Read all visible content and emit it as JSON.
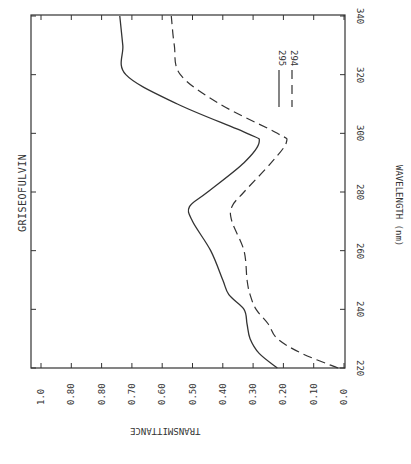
{
  "title": "GRISEOFULVIN",
  "chart_data": {
    "type": "line",
    "title": "GRISEOFULVIN",
    "xlabel": "WAVELENGTH (nm)",
    "ylabel": "TRANSMITTANCE",
    "orientation_note": "figure printed rotated 90 degrees; wavelength axis vertical on right, transmittance axis horizontal at bottom",
    "xlim": [
      220,
      340
    ],
    "ylim": [
      0.0,
      1.0
    ],
    "x_ticks": [
      "220",
      "240",
      "260",
      "280",
      "300",
      "320",
      "340"
    ],
    "y_ticks": [
      "1.0",
      "0.80",
      "0.80",
      "0.70",
      "0.60",
      "0.50",
      "0.40",
      "0.30",
      "0.20",
      "0.10",
      "0.0"
    ],
    "grid": false,
    "legend_position": "upper inside plot, near 320 nm",
    "x": [
      220,
      225,
      230,
      235,
      240,
      245,
      250,
      260,
      270,
      275,
      280,
      290,
      297,
      300,
      310,
      320,
      330,
      340
    ],
    "series": [
      {
        "name": "295",
        "style": "solid",
        "values": [
          0.22,
          0.28,
          0.31,
          0.32,
          0.33,
          0.38,
          0.4,
          0.44,
          0.5,
          0.51,
          0.45,
          0.33,
          0.28,
          0.32,
          0.55,
          0.72,
          0.73,
          0.74
        ]
      },
      {
        "name": "294",
        "style": "dashed",
        "values": [
          0.02,
          0.14,
          0.22,
          0.25,
          0.29,
          0.31,
          0.32,
          0.33,
          0.37,
          0.37,
          0.33,
          0.24,
          0.19,
          0.22,
          0.41,
          0.54,
          0.56,
          0.57
        ]
      }
    ]
  },
  "legend": {
    "items": [
      {
        "label": "295",
        "style": "solid"
      },
      {
        "label": "294",
        "style": "dashed"
      }
    ]
  },
  "colors": {
    "ink": "#333333",
    "background": "#ffffff"
  }
}
